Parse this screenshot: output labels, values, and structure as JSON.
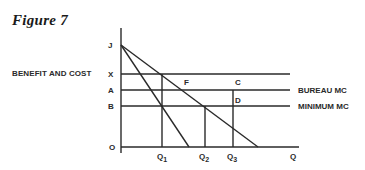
{
  "figure": {
    "title": "Figure 7",
    "y_axis_label": "BENEFIT AND COST",
    "x_axis_label": "Q",
    "origin_label": "O"
  },
  "y_levels": {
    "J": "J",
    "X": "X",
    "A": "A",
    "B": "B"
  },
  "x_points": {
    "Q1": {
      "base": "Q",
      "sub": "1"
    },
    "Q2": {
      "base": "Q",
      "sub": "2"
    },
    "Q3": {
      "base": "Q",
      "sub": "3"
    }
  },
  "point_labels": {
    "F": "F",
    "C": "C",
    "D": "D"
  },
  "curve_labels": {
    "bureau_mc": "BUREAU MC",
    "minimum_mc": "MINIMUM MC"
  },
  "colors": {
    "line": "#2a2a2a",
    "background": "#ffffff"
  }
}
